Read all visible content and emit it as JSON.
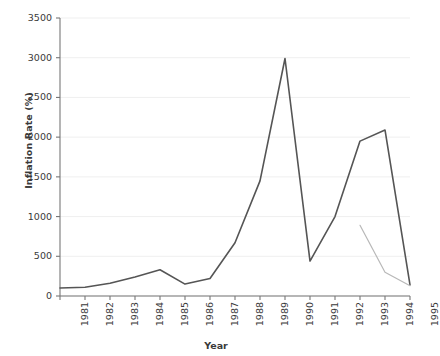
{
  "chart_data": {
    "type": "line",
    "title": "",
    "xlabel": "Year",
    "ylabel": "Inflation Rate (%)",
    "categories": [
      1981,
      1982,
      1983,
      1984,
      1985,
      1986,
      1987,
      1988,
      1989,
      1990,
      1991,
      1992,
      1993,
      1994,
      1995
    ],
    "x_tick_labels": [
      "1981",
      "1982",
      "1983",
      "1984",
      "1985",
      "1986",
      "1987",
      "1988",
      "1989",
      "1990",
      "1991",
      "1992",
      "1993",
      "1994",
      "1995"
    ],
    "y_tick_labels": [
      "0",
      "500",
      "1000",
      "1500",
      "2000",
      "2500",
      "3000",
      "3500"
    ],
    "y_ticks": [
      0,
      500,
      1000,
      1500,
      2000,
      2500,
      3000,
      3500
    ],
    "ylim": [
      0,
      3500
    ],
    "xlim": [
      1981,
      1995
    ],
    "grid": true,
    "grid_axis": "y",
    "legend": false,
    "legend_position": "none",
    "series": [
      {
        "name": "primary",
        "color": "#555555",
        "width": 1.6,
        "x": [
          1981,
          1982,
          1983,
          1984,
          1985,
          1986,
          1987,
          1988,
          1989,
          1990,
          1991,
          1992,
          1993,
          1994,
          1995
        ],
        "values": [
          100,
          110,
          160,
          240,
          330,
          150,
          220,
          670,
          1450,
          2990,
          440,
          1000,
          1950,
          2090,
          140
        ]
      },
      {
        "name": "secondary",
        "color": "#b8b8b8",
        "width": 1.2,
        "x": [
          1993,
          1994,
          1995
        ],
        "values": [
          890,
          300,
          130
        ]
      }
    ]
  },
  "colors": {
    "axis": "#777777",
    "grid": "#efefef",
    "text": "#3a3a3a",
    "background": "#ffffff",
    "primary_series": "#555555",
    "secondary_series": "#b8b8b8"
  }
}
